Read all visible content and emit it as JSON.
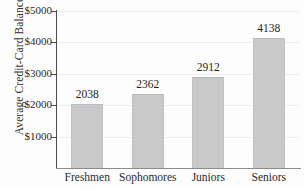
{
  "chart_data": {
    "type": "bar",
    "title": "",
    "xlabel": "",
    "ylabel": "Average Credit-Card Balance",
    "categories": [
      "Freshmen",
      "Sophomores",
      "Juniors",
      "Seniors"
    ],
    "values": [
      2038,
      2362,
      2912,
      4138
    ],
    "value_labels": [
      "2038",
      "2362",
      "2912",
      "4138"
    ],
    "ylim": [
      0,
      5000
    ],
    "ytick_values": [
      1000,
      2000,
      3000,
      4000,
      5000
    ],
    "ytick_labels": [
      "$1000",
      "$2000",
      "$3000",
      "$4000",
      "$5000"
    ],
    "grid": true,
    "legend": "none",
    "bar_color": "#c9c9c9",
    "axis_color": "#4c4c4c",
    "gridline_color": "#ededed",
    "background_color": "#fdfdfd"
  }
}
